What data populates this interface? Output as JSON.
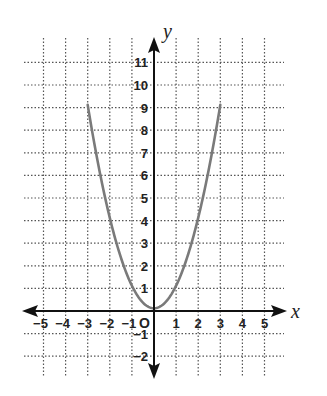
{
  "chart_data": {
    "type": "line",
    "title": "",
    "xlabel": "x",
    "ylabel": "y",
    "origin_label": "O",
    "xlim": [
      -5.5,
      6
    ],
    "ylim": [
      -2.5,
      12
    ],
    "grid": true,
    "grid_style": "dotted",
    "x_ticks": [
      -5,
      -4,
      -3,
      -2,
      -1,
      1,
      2,
      3,
      4,
      5
    ],
    "y_ticks": [
      -2,
      -1,
      1,
      2,
      3,
      4,
      5,
      6,
      7,
      8,
      9,
      10,
      11
    ],
    "series": [
      {
        "name": "y = x^2",
        "x": [
          -3,
          -2.5,
          -2,
          -1.5,
          -1,
          -0.5,
          0,
          0.5,
          1,
          1.5,
          2,
          2.5,
          3
        ],
        "y": [
          9,
          6.25,
          4,
          2.25,
          1,
          0.25,
          0,
          0.25,
          1,
          2.25,
          4,
          6.25,
          9
        ],
        "color": "#7a7a7a"
      }
    ]
  },
  "labels": {
    "x_axis": "x",
    "y_axis": "y",
    "origin": "O"
  },
  "colors": {
    "axis": "#111111",
    "grid": "#555555",
    "curve": "#7a7a7a"
  }
}
